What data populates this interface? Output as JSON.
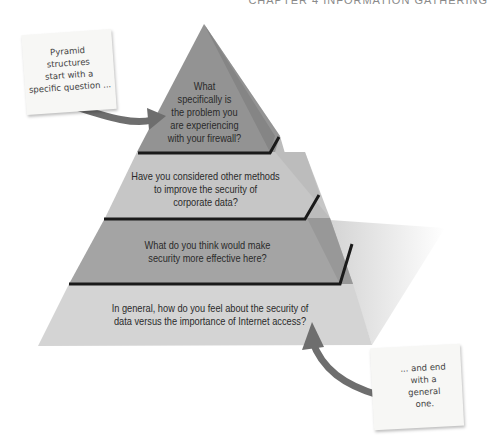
{
  "header": {
    "text": "CHAPTER 4   INFORMATION GATHERING"
  },
  "pyramid": {
    "tiers": [
      {
        "level": 1,
        "label": "What specifically is the problem you are experiencing with your firewall?",
        "lines": [
          "What",
          "specifically is",
          "the problem you",
          "are experiencing",
          "with your firewall?"
        ],
        "color": "#8f8f8f"
      },
      {
        "level": 2,
        "label": "Have you considered other methods to improve the security of corporate data?",
        "lines": [
          "Have you considered other methods",
          "to improve the security of",
          "corporate data?"
        ],
        "color": "#c4c4c4"
      },
      {
        "level": 3,
        "label": "What do you think would make security more effective here?",
        "lines": [
          "What do you think would make",
          "security more effective here?"
        ],
        "color": "#a3a3a3"
      },
      {
        "level": 4,
        "label": "In general, how do you feel about the security of data versus the importance of Internet access?",
        "lines": [
          "In general, how do you feel about the security of",
          "data versus the importance of Internet access?"
        ],
        "color": "#d2d2d2"
      }
    ]
  },
  "notes": {
    "top": {
      "lines": [
        "Pyramid",
        "structures",
        "start with a",
        "specific question ..."
      ]
    },
    "bottom": {
      "lines": [
        "... and end",
        "with a",
        "general",
        "one."
      ]
    }
  },
  "colors": {
    "arrow": "#6e6e6e",
    "divider": "#1a1a1a",
    "side_face": "#9a9a9a",
    "shadow": "#e4e4e4"
  }
}
